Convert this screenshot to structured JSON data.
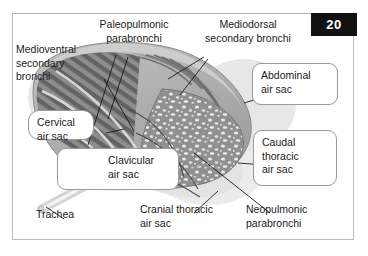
{
  "figure": {
    "page_number": "20"
  },
  "labels": {
    "paleopulmonic": "Paleopulmonic\nparabronchi",
    "mediodorsal": "Mediodorsal\nsecondary bronchi",
    "medioventral": "Medioventral\nsecondary\nbronchi",
    "cervical": "Cervical\nair sac",
    "abdominal": "Abdominal\nair sac",
    "caudal_thoracic": "Caudal\nthoracic\nair sac",
    "clavicular": "Clavicular\nair sac",
    "cranial_thoracic": "Cranial thoracic\nair sac",
    "neopulmonic": "Neopulmonic\nparabronchi",
    "trachea": "Trachea"
  },
  "colors": {
    "badge_background": "#111111",
    "badge_text": "#ffffff",
    "frame_border": "#b9b9b9",
    "callout_border": "#9a9a9a",
    "text": "#1b1b1b",
    "lung_dark": "#6e6e6e",
    "lung_mid": "#8f8f8f",
    "lung_light": "#b4b4b4",
    "air_sac_pale": "#dedede",
    "page_background": "#ffffff"
  },
  "icons": {
    "page_badge": "page-number-badge",
    "figure_frame": "figure-border-frame"
  }
}
